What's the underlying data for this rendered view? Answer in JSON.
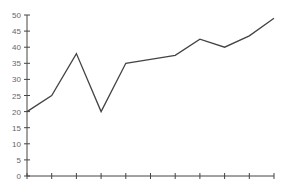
{
  "chart_data": {
    "type": "line",
    "title": "",
    "xlabel": "",
    "ylabel": "",
    "x": [
      1,
      2,
      3,
      4,
      5,
      6,
      7,
      8,
      9,
      10,
      11
    ],
    "values": [
      20,
      25,
      38,
      20,
      35,
      36.25,
      37.5,
      42.5,
      40,
      43.5,
      49
    ],
    "series": [
      {
        "name": "series-1",
        "values": [
          20,
          25,
          38,
          20,
          35,
          36.25,
          37.5,
          42.5,
          40,
          43.5,
          49
        ],
        "color": "#444444"
      }
    ],
    "ylim": [
      0,
      50
    ],
    "yticks": [
      0,
      5,
      10,
      15,
      20,
      25,
      30,
      35,
      40,
      45,
      50
    ],
    "xtick_labels": [],
    "grid": false,
    "legend": "none"
  }
}
